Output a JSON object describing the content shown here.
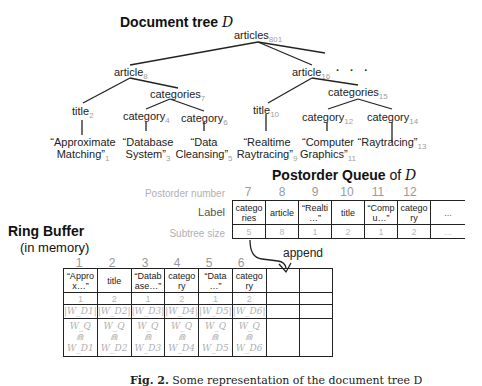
{
  "tree": {
    "heading": "Document tree",
    "heading_var": "D",
    "nodes": [
      {
        "label": "articles",
        "num": "801"
      },
      {
        "label": "article",
        "num": "8"
      },
      {
        "label": "article",
        "num": "16"
      },
      {
        "label": "title",
        "num": "2"
      },
      {
        "label": "categories",
        "num": "7"
      },
      {
        "label": "category",
        "num": "4"
      },
      {
        "label": "category",
        "num": "6"
      },
      {
        "label": "title",
        "num": "10"
      },
      {
        "label": "categories",
        "num": "15"
      },
      {
        "label": "category",
        "num": "12"
      },
      {
        "label": "category",
        "num": "14"
      }
    ],
    "leaves": [
      {
        "line1": "“Approximate",
        "line2": "Matching”",
        "num": "1"
      },
      {
        "line1": "“Database",
        "line2": "System”",
        "num": "3"
      },
      {
        "line1": "“Data",
        "line2": "Cleansing”",
        "num": "5"
      },
      {
        "line1": "“Realtime",
        "line2": "Raytracing”",
        "num": "9"
      },
      {
        "line1": "“Computer",
        "line2": "Graphics”",
        "num": "11"
      },
      {
        "line1": "",
        "line2": "“Raytracing”",
        "num": "13"
      }
    ],
    "ellipsis": ". . ."
  },
  "queue": {
    "heading": "Postorder Queue",
    "heading_of": "of",
    "heading_var": "D",
    "row_labels": {
      "postorder": "Postorder number",
      "label": "Label",
      "size": "Subtree size"
    },
    "postorder_numbers": [
      "7",
      "8",
      "9",
      "10",
      "11",
      "12"
    ],
    "cells": [
      {
        "label_l1": "catego",
        "label_l2": "ries",
        "size": "5"
      },
      {
        "label_l1": "article",
        "label_l2": "",
        "size": "8"
      },
      {
        "label_l1": "“Realti",
        "label_l2": "…”",
        "size": "1"
      },
      {
        "label_l1": "title",
        "label_l2": "",
        "size": "2"
      },
      {
        "label_l1": "“Comp",
        "label_l2": "u…”",
        "size": "1"
      },
      {
        "label_l1": "catego",
        "label_l2": "ry",
        "size": "2"
      },
      {
        "label_l1": "...",
        "label_l2": "",
        "size": "..."
      }
    ],
    "append_label": "append"
  },
  "ring": {
    "heading": "Ring Buffer",
    "subheading": "(in memory)",
    "indices": [
      "1",
      "2",
      "3",
      "4",
      "5",
      "6"
    ],
    "cells": [
      {
        "l1": "“Appro",
        "l2": "x…”",
        "size": "1",
        "w": "|W_D1|",
        "wq": "W_Q",
        "cap": "⋒",
        "wd": "W_D1"
      },
      {
        "l1": "title",
        "l2": "",
        "size": "2",
        "w": "|W_D2|",
        "wq": "W_Q",
        "cap": "⋒",
        "wd": "W_D2"
      },
      {
        "l1": "“Datab",
        "l2": "ase…”",
        "size": "1",
        "w": "|W_D3|",
        "wq": "W_Q",
        "cap": "⋒",
        "wd": "W_D3"
      },
      {
        "l1": "catego",
        "l2": "ry",
        "size": "2",
        "w": "|W_D4|",
        "wq": "W_Q",
        "cap": "⋒",
        "wd": "W_D4"
      },
      {
        "l1": "“Data",
        "l2": "…”",
        "size": "1",
        "w": "|W_D5|",
        "wq": "W_Q",
        "cap": "⋒",
        "wd": "W_D5"
      },
      {
        "l1": "catego",
        "l2": "ry",
        "size": "2",
        "w": "|W_D6|",
        "wq": "W_Q",
        "cap": "⋒",
        "wd": "W_D6"
      }
    ]
  },
  "caption": {
    "fig": "Fig. 2.",
    "text": "Some representation of the document tree D"
  }
}
